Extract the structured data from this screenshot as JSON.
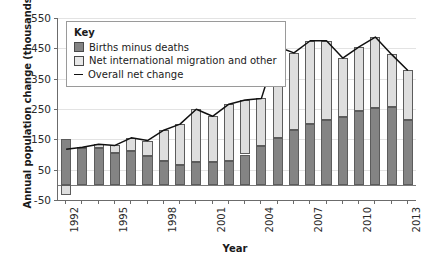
{
  "chart_data": {
    "type": "bar",
    "subtype": "stacked-bar-with-line",
    "title": "",
    "xlabel": "Year",
    "ylabel": "Annual population change (thousands)",
    "ylim": [
      -50,
      550
    ],
    "yticks": [
      -50,
      50,
      150,
      250,
      350,
      450,
      550
    ],
    "grid": true,
    "legend_position": "top-left",
    "legend_title": "Key",
    "categories": [
      1992,
      1993,
      1994,
      1995,
      1996,
      1997,
      1998,
      1999,
      2000,
      2001,
      2002,
      2003,
      2004,
      2005,
      2006,
      2007,
      2008,
      2009,
      2010,
      2011,
      2012,
      2013
    ],
    "xtick_labels": [
      "1992",
      "1995",
      "1998",
      "2001",
      "2004",
      "2007",
      "2010",
      "2013"
    ],
    "series": [
      {
        "name": "Births minus deaths",
        "color": "#848484",
        "values": [
          152,
          124,
          121,
          106,
          110,
          96,
          80,
          65,
          74,
          76,
          78,
          100,
          128,
          155,
          180,
          200,
          215,
          225,
          245,
          252,
          255,
          215
        ]
      },
      {
        "name": "Net international migration and other",
        "color": "#dedede",
        "values": [
          -35,
          0,
          13,
          24,
          45,
          50,
          100,
          135,
          175,
          150,
          188,
          180,
          157,
          300,
          255,
          275,
          260,
          193,
          210,
          235,
          175,
          162
        ]
      }
    ],
    "line_series": {
      "name": "Overall net change",
      "color": "#111111",
      "values": [
        117,
        124,
        134,
        130,
        155,
        146,
        180,
        200,
        249,
        226,
        266,
        280,
        285,
        455,
        435,
        475,
        475,
        418,
        455,
        487,
        430,
        377
      ]
    }
  },
  "axes": {
    "y_title": "Annual population change (thousands)",
    "x_title": "Year",
    "y_tick_labels": [
      "550",
      "450",
      "350",
      "250",
      "150",
      "50",
      "-50"
    ]
  },
  "legend": {
    "title": "Key",
    "items": [
      {
        "label": "Births minus deaths",
        "kind": "swatch-dark"
      },
      {
        "label": "Net international migration and other",
        "kind": "swatch-light"
      },
      {
        "label": "Overall net change",
        "kind": "line"
      }
    ]
  }
}
